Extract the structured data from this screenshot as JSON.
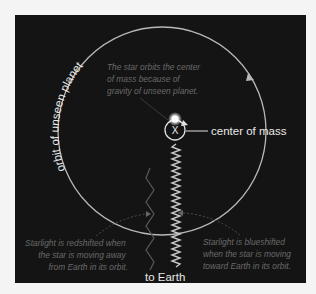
{
  "diagram": {
    "orbit_label": "orbit of unseen planet",
    "star_note": {
      "lines": [
        "The star orbits the center",
        "of mass because of",
        "gravity of unseen planet."
      ]
    },
    "center_marker": "X",
    "center_label": "center of mass",
    "redshift_note": {
      "lines": [
        "Starlight is redshifted when",
        "the star is moving away",
        "from Earth in its orbit."
      ]
    },
    "blueshift_note": {
      "lines": [
        "Starlight is blueshifted",
        "when the star is moving",
        "toward Earth in its orbit."
      ]
    },
    "earth_label": "to Earth",
    "colors": {
      "background": "#141414",
      "page": "#f4f4f4",
      "orbit_line": "#b8b8b8",
      "label": "#e8e8e8",
      "note_text": "#6a6a6a"
    }
  }
}
